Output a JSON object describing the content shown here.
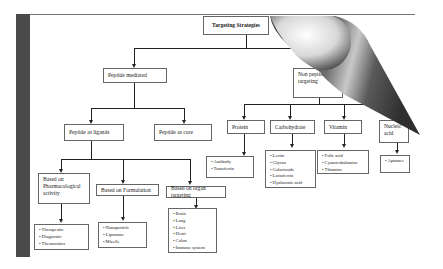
{
  "diagram": {
    "root": {
      "label": "Targeting Strategies"
    },
    "peptide_mediated": {
      "label": "Peptide mediated",
      "children": {
        "ligands": {
          "label": "Peptide as ligands",
          "children": {
            "pharmacological": {
              "label": "Based on Pharmacological activity",
              "items": [
                "Therapeutic",
                "Diagnostic",
                "Theranostics"
              ]
            },
            "formulation": {
              "label": "Based on Formulation",
              "items": [
                "Nanoparticle",
                "Liposome",
                "Micelle"
              ]
            },
            "organ": {
              "label": "Based on organ targeting",
              "items": [
                "Brain",
                "Lung",
                "Liver",
                "Heart",
                "Colon",
                "Immune system"
              ]
            }
          }
        },
        "core": {
          "label": "Peptide as core"
        }
      }
    },
    "non_peptide": {
      "label": "Non peptide targeting",
      "children": {
        "protein": {
          "label": "Protein",
          "items": [
            "Antibody",
            "Transferrin"
          ]
        },
        "carbohydrate": {
          "label": "Carbohydrate",
          "items": [
            "Lectin",
            "Glycan",
            "Galactoside",
            "Lactoferrin",
            "Hyaluronic acid"
          ]
        },
        "vitamin": {
          "label": "Vitamin",
          "items": [
            "Folic acid",
            "Cyanocobalamine",
            "Thiamine"
          ]
        },
        "nucleic_acid": {
          "label": "Nucleic acid",
          "items": [
            "Aptamer"
          ]
        }
      }
    }
  },
  "colors": {
    "sidebar": "#4a4a4a",
    "line": "#222222",
    "border": "#666666"
  }
}
